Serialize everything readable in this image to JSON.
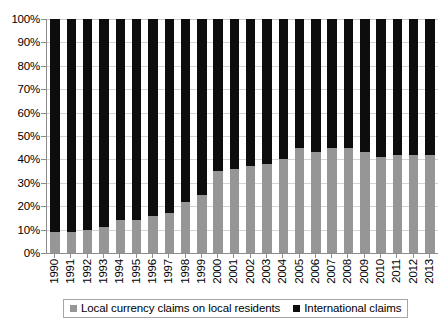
{
  "chart_data": {
    "type": "bar",
    "stacked": true,
    "stack_total": 100,
    "title": "",
    "subtitle": "",
    "xlabel": "",
    "ylabel": "",
    "ylim": [
      0,
      100
    ],
    "y_unit": "%",
    "grid": true,
    "legend_position": "bottom",
    "categories": [
      "1990",
      "1991",
      "1992",
      "1993",
      "1994",
      "1995",
      "1996",
      "1997",
      "1998",
      "1999",
      "2000",
      "2001",
      "2002",
      "2003",
      "2004",
      "2005",
      "2006",
      "2007",
      "2008",
      "2009",
      "2010",
      "2011",
      "2012",
      "2013"
    ],
    "y_ticks": [
      "0%",
      "10%",
      "20%",
      "30%",
      "40%",
      "50%",
      "60%",
      "70%",
      "80%",
      "90%",
      "100%"
    ],
    "y_tick_values": [
      0,
      10,
      20,
      30,
      40,
      50,
      60,
      70,
      80,
      90,
      100
    ],
    "series": [
      {
        "name": "Local currency claims on local residents",
        "color": "#969696",
        "values": [
          9,
          9,
          10,
          11,
          14,
          14,
          16,
          17,
          22,
          25,
          35,
          36,
          37,
          38,
          40,
          45,
          43,
          45,
          45,
          43,
          41,
          42,
          42,
          42
        ]
      },
      {
        "name": "International claims",
        "color": "#0d0d0d",
        "values": [
          91,
          91,
          90,
          89,
          86,
          86,
          84,
          83,
          78,
          75,
          65,
          64,
          63,
          62,
          60,
          55,
          57,
          55,
          55,
          57,
          59,
          58,
          58,
          58
        ]
      }
    ]
  },
  "legend": {
    "items": [
      {
        "label": "Local currency claims on local residents",
        "color": "#969696"
      },
      {
        "label": "International claims",
        "color": "#0d0d0d"
      }
    ]
  }
}
